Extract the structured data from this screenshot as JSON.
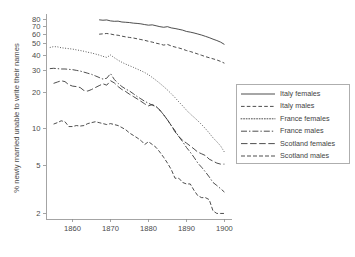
{
  "chart_data": {
    "type": "line",
    "title": "",
    "xlabel": "",
    "ylabel": "% newly married unable to write their names",
    "yscale": "log",
    "ylim": [
      1.8,
      88
    ],
    "xlim": [
      1853,
      1902
    ],
    "grid": false,
    "legend_position": "right",
    "ytick_labels": [
      "80",
      "70",
      "60",
      "50",
      "40",
      "30",
      "20",
      "10",
      "5",
      "2"
    ],
    "ytick_values": [
      80,
      70,
      60,
      50,
      40,
      30,
      20,
      10,
      5,
      2
    ],
    "xtick_labels": [
      "1860",
      "1870",
      "1880",
      "1890",
      "1900"
    ],
    "xtick_values": [
      1860,
      1870,
      1880,
      1890,
      1900
    ],
    "series": [
      {
        "name": "Italy females",
        "style": "solid",
        "x": [
          1867,
          1868,
          1869,
          1870,
          1871,
          1872,
          1873,
          1874,
          1875,
          1876,
          1877,
          1878,
          1879,
          1880,
          1881,
          1882,
          1883,
          1884,
          1885,
          1886,
          1887,
          1888,
          1889,
          1890,
          1891,
          1892,
          1893,
          1894,
          1895,
          1896,
          1897,
          1898,
          1899,
          1900
        ],
        "values": [
          78.8,
          78.2,
          78.6,
          77.2,
          76.6,
          76.8,
          75.6,
          75.2,
          74.8,
          74.0,
          73.6,
          73.0,
          72.0,
          71.2,
          71.6,
          70.4,
          69.2,
          68.4,
          69.2,
          67.6,
          66.8,
          65.8,
          64.8,
          63.2,
          62.4,
          61.4,
          60.2,
          59.0,
          57.6,
          56.2,
          54.6,
          53.2,
          51.6,
          49.4
        ]
      },
      {
        "name": "Italy males",
        "style": "dashed",
        "x": [
          1867,
          1868,
          1869,
          1870,
          1871,
          1872,
          1873,
          1874,
          1875,
          1876,
          1877,
          1878,
          1879,
          1880,
          1881,
          1882,
          1883,
          1884,
          1885,
          1886,
          1887,
          1888,
          1889,
          1890,
          1891,
          1892,
          1893,
          1894,
          1895,
          1896,
          1897,
          1898,
          1899,
          1900
        ],
        "values": [
          60.0,
          60.4,
          60.8,
          60.2,
          59.2,
          58.8,
          57.8,
          57.0,
          56.4,
          55.8,
          55.0,
          54.2,
          53.4,
          52.4,
          51.6,
          50.6,
          49.8,
          48.8,
          49.4,
          48.0,
          47.0,
          46.2,
          45.2,
          44.0,
          43.2,
          42.2,
          41.2,
          40.2,
          39.2,
          38.4,
          37.6,
          36.8,
          35.8,
          34.6
        ]
      },
      {
        "name": "France females",
        "style": "dotted",
        "x": [
          1854,
          1855,
          1856,
          1857,
          1858,
          1859,
          1860,
          1861,
          1862,
          1863,
          1864,
          1865,
          1866,
          1867,
          1868,
          1869,
          1870,
          1871,
          1872,
          1873,
          1874,
          1875,
          1876,
          1877,
          1878,
          1879,
          1880,
          1881,
          1882,
          1883,
          1884,
          1885,
          1886,
          1887,
          1888,
          1889,
          1890,
          1891,
          1892,
          1893,
          1894,
          1895,
          1896,
          1897,
          1898,
          1899,
          1900
        ],
        "values": [
          46.6,
          47.4,
          47.2,
          46.4,
          46.0,
          45.6,
          45.2,
          44.6,
          44.0,
          43.4,
          42.6,
          42.0,
          41.2,
          40.4,
          39.4,
          38.6,
          40.4,
          38.4,
          36.6,
          35.2,
          34.0,
          33.0,
          32.0,
          31.0,
          30.0,
          29.0,
          27.8,
          26.4,
          25.0,
          23.6,
          22.2,
          20.8,
          19.4,
          18.0,
          16.6,
          15.4,
          14.2,
          13.2,
          12.4,
          11.6,
          10.8,
          10.0,
          9.2,
          8.4,
          7.8,
          7.2,
          6.4
        ]
      },
      {
        "name": "France males",
        "style": "long-dash-dot",
        "x": [
          1854,
          1855,
          1856,
          1857,
          1858,
          1859,
          1860,
          1861,
          1862,
          1863,
          1864,
          1865,
          1866,
          1867,
          1868,
          1869,
          1870,
          1871,
          1872,
          1873,
          1874,
          1875,
          1876,
          1877,
          1878,
          1879,
          1880,
          1881,
          1882,
          1883,
          1884,
          1885,
          1886,
          1887,
          1888,
          1889,
          1890,
          1891,
          1892,
          1893,
          1894,
          1895,
          1896,
          1897,
          1898,
          1899,
          1900
        ],
        "values": [
          31.2,
          31.4,
          31.2,
          31.0,
          31.0,
          30.8,
          30.6,
          30.2,
          29.8,
          29.2,
          28.6,
          28.0,
          27.2,
          26.4,
          25.6,
          26.0,
          28.4,
          25.4,
          23.6,
          22.2,
          21.2,
          20.4,
          19.4,
          18.4,
          17.6,
          16.8,
          16.2,
          15.6,
          15.2,
          14.2,
          13.0,
          11.8,
          10.6,
          9.6,
          8.6,
          7.8,
          7.0,
          6.4,
          5.8,
          5.2,
          4.8,
          4.4,
          4.0,
          3.6,
          3.4,
          3.2,
          3.0
        ]
      },
      {
        "name": "Scotland females",
        "style": "long-dash",
        "x": [
          1855,
          1856,
          1857,
          1858,
          1859,
          1860,
          1861,
          1862,
          1863,
          1864,
          1865,
          1866,
          1867,
          1868,
          1869,
          1870,
          1871,
          1872,
          1873,
          1874,
          1875,
          1876,
          1877,
          1878,
          1879,
          1880,
          1881,
          1882,
          1883,
          1884,
          1885,
          1886,
          1887,
          1888,
          1889,
          1890,
          1891,
          1892,
          1893,
          1894,
          1895,
          1896,
          1897,
          1898,
          1899,
          1900
        ],
        "values": [
          23.6,
          24.2,
          24.8,
          24.4,
          23.0,
          22.4,
          22.2,
          21.8,
          20.6,
          20.4,
          21.0,
          21.8,
          22.6,
          23.4,
          22.8,
          24.8,
          23.8,
          22.2,
          21.0,
          20.2,
          19.2,
          18.4,
          17.6,
          16.8,
          16.0,
          15.4,
          15.8,
          15.2,
          14.2,
          13.0,
          11.8,
          10.6,
          9.4,
          8.6,
          8.0,
          7.6,
          7.2,
          6.8,
          6.4,
          6.2,
          6.0,
          5.6,
          5.4,
          5.2,
          5.1,
          5.1
        ]
      },
      {
        "name": "Scotland males",
        "style": "dash-dot",
        "x": [
          1855,
          1856,
          1857,
          1858,
          1859,
          1860,
          1861,
          1862,
          1863,
          1864,
          1865,
          1866,
          1867,
          1868,
          1869,
          1870,
          1871,
          1872,
          1873,
          1874,
          1875,
          1876,
          1877,
          1878,
          1879,
          1880,
          1881,
          1882,
          1883,
          1884,
          1885,
          1886,
          1887,
          1888,
          1889,
          1890,
          1891,
          1892,
          1893,
          1894,
          1895,
          1896,
          1897,
          1898,
          1899,
          1900
        ],
        "values": [
          10.9,
          11.2,
          11.6,
          11.4,
          10.4,
          10.4,
          10.6,
          10.5,
          10.6,
          11.0,
          11.2,
          11.4,
          11.2,
          11.0,
          10.8,
          11.0,
          10.8,
          10.6,
          10.2,
          9.8,
          9.2,
          8.8,
          8.4,
          8.0,
          7.4,
          7.8,
          7.4,
          7.0,
          6.4,
          5.8,
          5.2,
          4.6,
          3.9,
          3.9,
          3.6,
          3.5,
          3.5,
          3.1,
          2.8,
          2.7,
          2.7,
          2.6,
          2.1,
          2.0,
          2.0,
          2.0
        ]
      }
    ]
  },
  "legend": {
    "items": [
      {
        "label": "Italy females",
        "style": "solid"
      },
      {
        "label": "Italy males",
        "style": "dashed"
      },
      {
        "label": "France females",
        "style": "dotted"
      },
      {
        "label": "France males",
        "style": "long-dash-dot"
      },
      {
        "label": "Scotland females",
        "style": "long-dash"
      },
      {
        "label": "Scotland males",
        "style": "dash-dot"
      }
    ]
  },
  "colors": {
    "line": "#2e2e2e",
    "axis": "#8d8d8d",
    "text": "#3f3f3f",
    "background": "#ffffff"
  }
}
